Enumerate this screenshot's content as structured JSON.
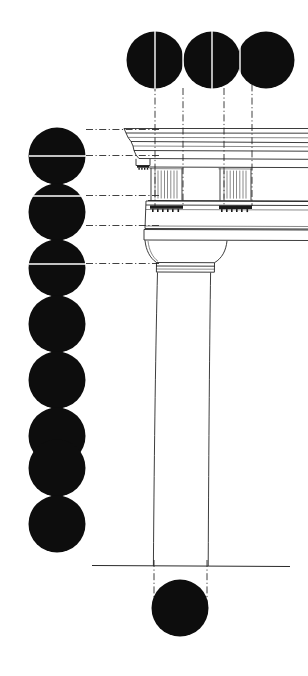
{
  "figure": {
    "technique": "Line drawing with solid circular module markers",
    "background_color": "#ffffff",
    "ink_color": "#1a1a1a",
    "module_color": "#0d0d0d",
    "guide_color": "#2b2b2b",
    "canvas": {
      "width": 308,
      "height": 676
    }
  },
  "module_scales": {
    "top_row": {
      "name": "horizontal-module-row",
      "description": "Three tangent solid circles across the top measuring intercolumniation",
      "count": 3,
      "diameter": 57,
      "center_y": 60,
      "centers_x": [
        155,
        212,
        266
      ],
      "split_line_color": "#ffffff"
    },
    "left_column": {
      "name": "vertical-module-column",
      "description": "Eight overlapping solid circles down the left edge measuring order height",
      "count": 8,
      "diameter": 57,
      "center_x": 57,
      "first_center_y": 156,
      "spacing": 56,
      "split_line_color": "#ffffff"
    },
    "base_module": {
      "name": "base-module-circle",
      "description": "Single solid circle beneath the ground line marking the lower shaft diameter",
      "count": 1,
      "diameter": 57,
      "center_x": 180,
      "center_y": 608
    }
  },
  "guides": {
    "vertical_dashdot": {
      "label": "triglyph and metope centre lines",
      "x_positions": [
        155,
        183,
        224,
        252
      ],
      "y_top": 60,
      "y_bottom": 205
    },
    "vertical_shaft": {
      "label": "shaft axis projection lines",
      "x_positions": [
        155,
        207
      ],
      "y_top": 560,
      "y_bottom": 612
    },
    "horizontal_dashed": {
      "label": "entablature division lines",
      "y_positions": [
        130,
        156,
        196,
        226,
        264
      ],
      "x_left": 86,
      "x_right": 160
    }
  },
  "architecture": {
    "cornice": {
      "name": "cornice",
      "top_y": 128,
      "bottom_y": 160,
      "left_x": 124
    },
    "mutule": {
      "name": "mutule-with-guttae",
      "y": 162,
      "left_x": 128
    },
    "frieze": {
      "name": "doric-frieze",
      "top_y": 166,
      "bottom_y": 198
    },
    "triglyphs": {
      "name": "triglyph",
      "count": 2,
      "x_positions": [
        152,
        221
      ],
      "width": 31,
      "top_y": 166,
      "bottom_y": 198,
      "glyph_bars": 3
    },
    "regulae": {
      "name": "regula-with-guttae",
      "count": 2,
      "x_positions": [
        150,
        219
      ],
      "y": 202,
      "guttae_per_regula": 6
    },
    "architrave": {
      "name": "architrave",
      "top_y": 200,
      "bottom_y": 228
    },
    "taenia": {
      "name": "taenia",
      "y": 200
    },
    "abacus": {
      "name": "abacus",
      "top_y": 228,
      "bottom_y": 238,
      "left_x": 144,
      "right_x": 308
    },
    "echinus": {
      "name": "echinus",
      "top_y": 238,
      "bottom_y": 262,
      "left_x": 148,
      "right_x": 222
    },
    "neck_rings": {
      "name": "hypotrachelion-annulets",
      "y_positions": [
        262,
        266,
        270
      ],
      "left_x": 155,
      "right_x": 213
    },
    "shaft": {
      "name": "column-shaft",
      "top_y": 270,
      "bottom_y": 566,
      "top_left_x": 157,
      "top_right_x": 211,
      "bottom_left_x": 153,
      "bottom_right_x": 208,
      "entasis": true
    },
    "ground_line": {
      "name": "ground-line",
      "y": 565,
      "x_left": 92,
      "x_right": 290
    }
  }
}
